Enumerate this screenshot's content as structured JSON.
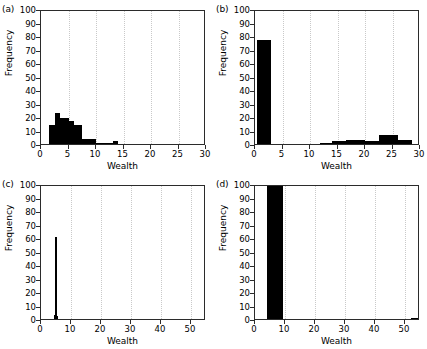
{
  "figure": {
    "panels": [
      {
        "tag": "(a)",
        "ylabel": "Frequency",
        "xlabel": "Wealth"
      },
      {
        "tag": "(b)",
        "ylabel": "Frequency",
        "xlabel": "Wealth"
      },
      {
        "tag": "(c)",
        "ylabel": "Frequency",
        "xlabel": "Wealth"
      },
      {
        "tag": "(d)",
        "ylabel": "Frequency",
        "xlabel": "Wealth"
      }
    ]
  },
  "chart_data": [
    {
      "type": "bar",
      "panel": "(a)",
      "title": "",
      "xlabel": "Wealth",
      "ylabel": "Frequency",
      "xlim": [
        0,
        30
      ],
      "ylim": [
        0,
        100
      ],
      "xticks": [
        0,
        5,
        10,
        15,
        20,
        25,
        30
      ],
      "yticks": [
        0,
        10,
        20,
        30,
        40,
        50,
        60,
        70,
        80,
        90,
        100
      ],
      "grid": "vertical-dotted",
      "legend": "none",
      "bin_edges": [
        1.4,
        2.6,
        3.4,
        4.3,
        5.1,
        6.0,
        7.4,
        8.2,
        10.0,
        13.0,
        14.0
      ],
      "bins": [
        {
          "x0": 1.4,
          "x1": 2.6,
          "value": 14
        },
        {
          "x0": 2.6,
          "x1": 3.4,
          "value": 23
        },
        {
          "x0": 3.4,
          "x1": 4.3,
          "value": 19
        },
        {
          "x0": 4.3,
          "x1": 5.1,
          "value": 19
        },
        {
          "x0": 5.1,
          "x1": 6.0,
          "value": 17
        },
        {
          "x0": 6.0,
          "x1": 7.4,
          "value": 14
        },
        {
          "x0": 7.4,
          "x1": 10.0,
          "value": 4
        },
        {
          "x0": 10.0,
          "x1": 13.0,
          "value": 1
        },
        {
          "x0": 13.0,
          "x1": 14.0,
          "value": 2
        }
      ]
    },
    {
      "type": "bar",
      "panel": "(b)",
      "title": "",
      "xlabel": "Wealth",
      "ylabel": "Frequency",
      "xlim": [
        0,
        30
      ],
      "ylim": [
        0,
        100
      ],
      "xticks": [
        0,
        5,
        10,
        15,
        20,
        25,
        30
      ],
      "yticks": [
        0,
        10,
        20,
        30,
        40,
        50,
        60,
        70,
        80,
        90,
        100
      ],
      "grid": "vertical-dotted",
      "legend": "none",
      "bins": [
        {
          "x0": 0.3,
          "x1": 3.0,
          "value": 77
        },
        {
          "x0": 11.8,
          "x1": 14.0,
          "value": 1
        },
        {
          "x0": 14.0,
          "x1": 16.5,
          "value": 2
        },
        {
          "x0": 16.5,
          "x1": 20.0,
          "value": 3
        },
        {
          "x0": 20.0,
          "x1": 22.5,
          "value": 2
        },
        {
          "x0": 22.5,
          "x1": 26.0,
          "value": 7
        },
        {
          "x0": 26.0,
          "x1": 28.5,
          "value": 3
        }
      ]
    },
    {
      "type": "bar",
      "panel": "(c)",
      "title": "",
      "xlabel": "Wealth",
      "ylabel": "Frequency",
      "xlim": [
        0,
        55
      ],
      "ylim": [
        0,
        100
      ],
      "xticks": [
        0,
        10,
        20,
        30,
        40,
        50
      ],
      "yticks": [
        0,
        10,
        20,
        30,
        40,
        50,
        60,
        70,
        80,
        90,
        100
      ],
      "grid": "vertical-dotted",
      "legend": "none",
      "bins": [
        {
          "x0": 4.6,
          "x1": 5.2,
          "value": 61
        },
        {
          "x0": 4.2,
          "x1": 4.6,
          "value": 3
        },
        {
          "x0": 5.2,
          "x1": 5.6,
          "value": 2
        }
      ]
    },
    {
      "type": "bar",
      "panel": "(d)",
      "title": "",
      "xlabel": "Wealth",
      "ylabel": "Frequency",
      "xlim": [
        0,
        55
      ],
      "ylim": [
        0,
        100
      ],
      "xticks": [
        0,
        10,
        20,
        30,
        40,
        50
      ],
      "yticks": [
        0,
        10,
        20,
        30,
        40,
        50,
        60,
        70,
        80,
        90,
        100
      ],
      "grid": "vertical-dotted",
      "legend": "none",
      "bins": [
        {
          "x0": 4.0,
          "x1": 9.3,
          "value": 100
        },
        {
          "x0": 52.0,
          "x1": 55.0,
          "value": 1
        }
      ]
    }
  ]
}
